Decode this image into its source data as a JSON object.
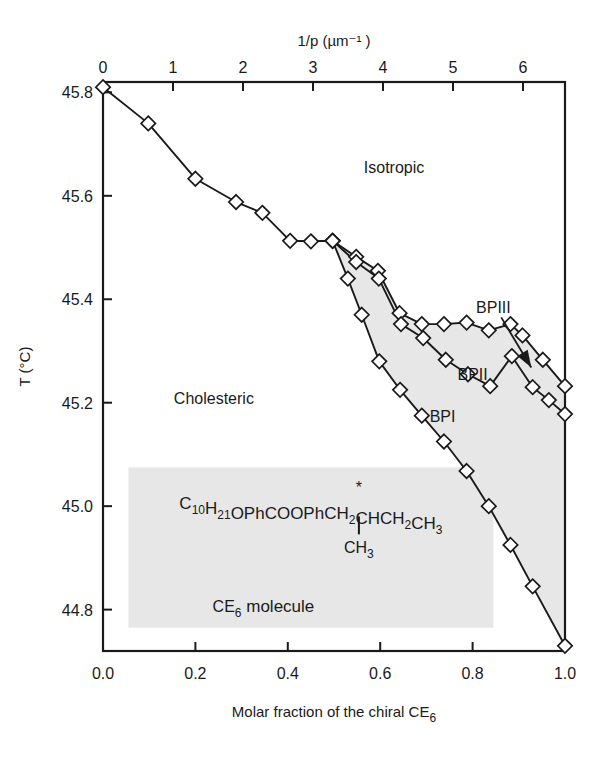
{
  "figure": {
    "background": "#ffffff",
    "line_color": "#1a1a1a",
    "marker_fill": "#ffffff",
    "shade_color": "#e7e7e7",
    "inset_bg": "#e7e7e7"
  },
  "axes": {
    "top": {
      "title": "1/p (µm⁻¹ )",
      "ticks": [
        "0",
        "1",
        "2",
        "3",
        "4",
        "5",
        "6"
      ],
      "tick_values": [
        0,
        1,
        2,
        3,
        4,
        5,
        6
      ],
      "range": [
        0,
        6.6
      ]
    },
    "bottom": {
      "title_main": "Molar fraction of the chiral CE",
      "title_sub": "6",
      "ticks": [
        "0.0",
        "0.2",
        "0.4",
        "0.6",
        "0.8",
        "1.0"
      ],
      "tick_values": [
        0.0,
        0.2,
        0.4,
        0.6,
        0.8,
        1.0
      ],
      "range": [
        0.0,
        1.0
      ]
    },
    "left": {
      "title": "T (°C)",
      "ticks": [
        "45.8",
        "45.6",
        "45.4",
        "45.2",
        "45.0",
        "44.8"
      ],
      "tick_values": [
        45.8,
        45.6,
        45.4,
        45.2,
        45.0,
        44.8
      ],
      "range": [
        44.72,
        45.82
      ]
    }
  },
  "region_labels": [
    {
      "name": "isotropic",
      "text": "Isotropic",
      "x": 0.63,
      "y": 45.655
    },
    {
      "name": "cholesteric",
      "text": "Cholesteric",
      "x": 0.24,
      "y": 45.21
    },
    {
      "name": "bp3",
      "text": "BPIII",
      "x": 0.845,
      "y": 45.385
    },
    {
      "name": "bp2",
      "text": "BPII",
      "x": 0.8,
      "y": 45.255
    },
    {
      "name": "bp1",
      "text": "BPI",
      "x": 0.735,
      "y": 45.175
    }
  ],
  "annotations": {
    "bp3_arrow": {
      "name": "bp3-arrow",
      "x1": 0.862,
      "y1": 45.365,
      "x2": 0.927,
      "y2": 45.268
    }
  },
  "inset": {
    "formula_prefix": "C",
    "formula": "C10H21OPhCOOPhCH2CHCH2CH3",
    "formula_parts": [
      {
        "t": "C",
        "sub": false
      },
      {
        "t": "10",
        "sub": true
      },
      {
        "t": "H",
        "sub": false
      },
      {
        "t": "21",
        "sub": true
      },
      {
        "t": "OPhCOOPhCH",
        "sub": false
      },
      {
        "t": "2",
        "sub": true
      },
      {
        "t": "CHCH",
        "sub": false
      },
      {
        "t": "2",
        "sub": true
      },
      {
        "t": "CH",
        "sub": false
      },
      {
        "t": "3",
        "sub": true
      }
    ],
    "chiral_star": "*",
    "branch": "CH",
    "branch_sub": "3",
    "caption_main": "CE",
    "caption_sub": "6",
    "caption_tail": " molecule"
  },
  "chart_data": {
    "type": "line",
    "title": "",
    "xlabel": "Molar fraction of the chiral CE6",
    "ylabel": "T (°C)",
    "xlim": [
      0.0,
      1.0
    ],
    "ylim": [
      44.72,
      45.82
    ],
    "x2label": "1/p (µm⁻¹)",
    "x2lim": [
      0.0,
      6.6
    ],
    "grid": false,
    "legend": "none",
    "marker": "diamond-open",
    "series": [
      {
        "name": "Isotropic - BPIII/BPII boundary (upper)",
        "points": [
          [
            0.0,
            45.81
          ],
          [
            0.098,
            45.74
          ],
          [
            0.2,
            45.633
          ],
          [
            0.288,
            45.588
          ],
          [
            0.345,
            45.567
          ],
          [
            0.405,
            45.513
          ],
          [
            0.45,
            45.512
          ],
          [
            0.497,
            45.513
          ],
          [
            0.548,
            45.482
          ],
          [
            0.595,
            45.455
          ],
          [
            0.642,
            45.373
          ],
          [
            0.69,
            45.352
          ],
          [
            0.738,
            45.352
          ],
          [
            0.787,
            45.355
          ],
          [
            0.835,
            45.34
          ],
          [
            0.882,
            45.352
          ],
          [
            0.908,
            45.33
          ],
          [
            0.952,
            45.283
          ],
          [
            1.0,
            45.232
          ]
        ]
      },
      {
        "name": "BPII - BPI boundary (middle)",
        "points": [
          [
            0.497,
            45.513
          ],
          [
            0.548,
            45.472
          ],
          [
            0.597,
            45.44
          ],
          [
            0.645,
            45.352
          ],
          [
            0.693,
            45.325
          ],
          [
            0.742,
            45.283
          ],
          [
            0.79,
            45.255
          ],
          [
            0.838,
            45.232
          ],
          [
            0.885,
            45.29
          ],
          [
            0.93,
            45.23
          ],
          [
            0.965,
            45.205
          ],
          [
            1.0,
            45.178
          ]
        ]
      },
      {
        "name": "BPI - Cholesteric boundary (lower)",
        "points": [
          [
            0.497,
            45.513
          ],
          [
            0.53,
            45.44
          ],
          [
            0.56,
            45.37
          ],
          [
            0.598,
            45.28
          ],
          [
            0.643,
            45.225
          ],
          [
            0.69,
            45.175
          ],
          [
            0.738,
            45.125
          ],
          [
            0.787,
            45.068
          ],
          [
            0.835,
            45.0
          ],
          [
            0.882,
            44.925
          ],
          [
            0.93,
            44.845
          ],
          [
            1.0,
            44.73
          ]
        ]
      }
    ]
  }
}
